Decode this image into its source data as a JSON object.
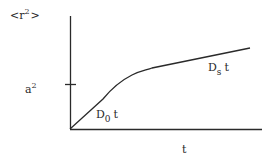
{
  "diagram": {
    "y_axis_label": {
      "base": "<r",
      "sup": "2",
      "end": ">"
    },
    "x_axis_label": "t",
    "tick_label": {
      "base": "a",
      "sup": "2"
    },
    "curve_labels": {
      "initial": {
        "base": "D",
        "sub": "0",
        "end": "t"
      },
      "final": {
        "base": "D",
        "sub": "s",
        "end": "t"
      }
    },
    "line_color": "#2a2a2a",
    "background": "#ffffff"
  }
}
